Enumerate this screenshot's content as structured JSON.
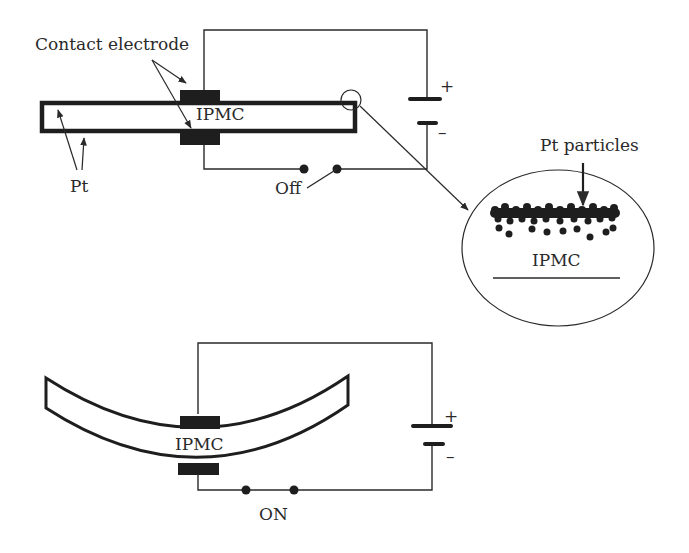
{
  "figure": {
    "top_panel": {
      "state": "off",
      "labels": {
        "contact_electrode": "Contact electrode",
        "pt": "Pt",
        "ipmc": "IPMC",
        "switch": "Off",
        "battery_plus": "+",
        "battery_minus": "–"
      }
    },
    "magnified_inset": {
      "labels": {
        "pt_particles": "Pt particles",
        "ipmc": "IPMC"
      }
    },
    "bottom_panel": {
      "state": "on",
      "labels": {
        "ipmc": "IPMC",
        "switch": "ON",
        "battery_plus": "+",
        "battery_minus": "–"
      }
    },
    "colors": {
      "stroke": "#2a2a2a",
      "electrode_fill": "#1e1e1e",
      "background": "#ffffff"
    }
  }
}
